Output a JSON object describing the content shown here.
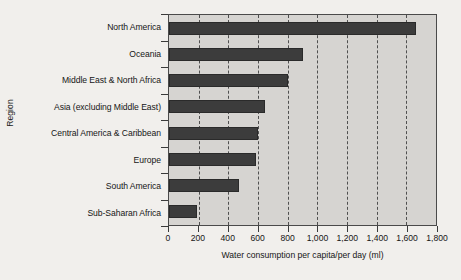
{
  "chart_data": {
    "type": "bar",
    "orientation": "horizontal",
    "title": "",
    "xlabel": "Water consumption per capita/per day (ml)",
    "ylabel": "Region",
    "categories": [
      "North America",
      "Oceania",
      "Middle East & North Africa",
      "Asia (excluding Middle East)",
      "Central America & Caribbean",
      "Europe",
      "South America",
      "Sub-Saharan Africa"
    ],
    "values": [
      1667,
      904,
      803,
      649,
      602,
      589,
      469,
      187
    ],
    "xlim": [
      0,
      1800
    ],
    "xticks": [
      0,
      200,
      400,
      600,
      800,
      1000,
      1200,
      1400,
      1600,
      1800
    ],
    "xticklabels": [
      "0",
      "200",
      "400",
      "600",
      "800",
      "1,000",
      "1,200",
      "1,400",
      "1,600",
      "1,800"
    ],
    "grid": "vertical-dashed",
    "legend": null,
    "colors": {
      "bar": "#3c3c3c",
      "plot_background": "#d6d4d1",
      "figure_background": "#f1efec",
      "axis": "#4a4a4a",
      "gridline": "#4f4f4f",
      "text": "#161616"
    }
  }
}
